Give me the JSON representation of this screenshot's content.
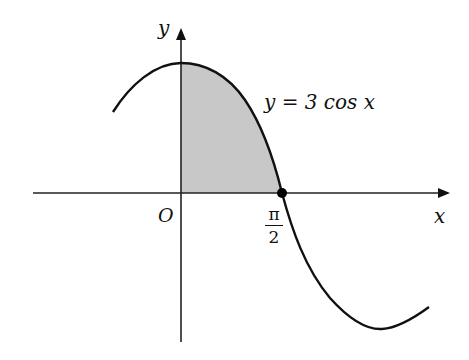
{
  "diagram": {
    "function_label": "y = 3 cos x",
    "axes": {
      "x_label": "x",
      "y_label": "y",
      "origin_label": "O"
    },
    "marked_point": {
      "label_numerator": "π",
      "label_denominator": "2",
      "description": "x-intercept at π/2"
    },
    "shaded_region": "area under y = 3 cos x from x = 0 to x = π/2",
    "colors": {
      "curve": "#111111",
      "axes": "#222222",
      "shade": "#c8c8c8"
    }
  }
}
